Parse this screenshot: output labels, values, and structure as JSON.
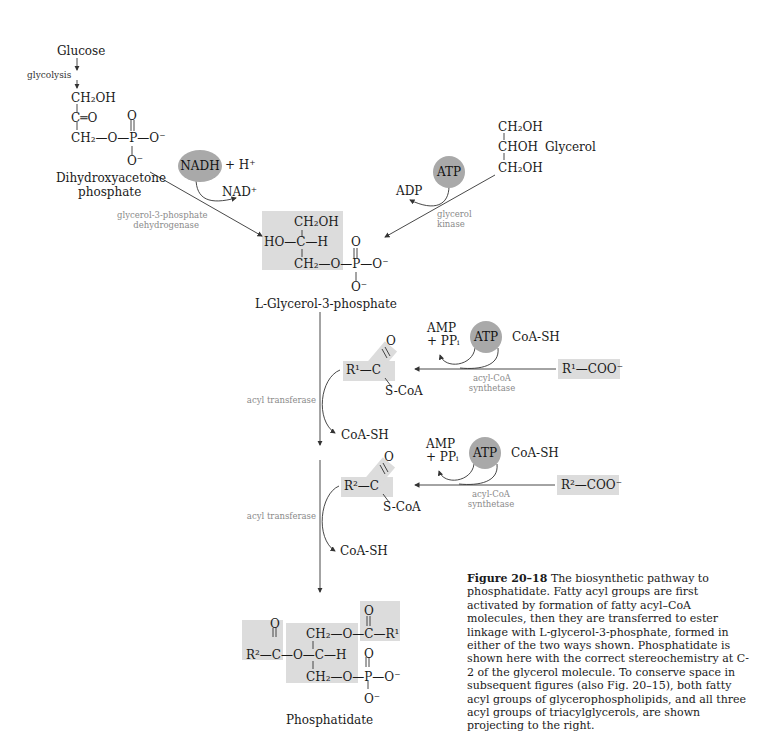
{
  "figure": {
    "number": "Figure 20–18",
    "caption": " The biosynthetic pathway to phosphatidate. Fatty acyl groups are first activated by formation of fatty acyl–CoA molecules, then they are transferred to ester linkage with L-glycerol-3-phosphate, formed in either of the two ways shown. Phosphatidate is shown here with the correct stereochemistry at C-2 of the glycerol molecule. To conserve space in subsequent figures (also Fig. 20–15), both fatty acyl groups of glycerophospholipids, and all three acyl groups of triacylglycerols, are shown projecting to the right."
  },
  "colors": {
    "shade": "#dcdcdc",
    "cofactor_circle": "#a9a9a9",
    "enzyme_text": "#8a8a8a",
    "line": "#333333"
  },
  "left_branch": {
    "start": "Glucose",
    "step_label": "glycolysis",
    "dhap": {
      "line1": "CH₂OH",
      "line2": "C═O",
      "line3": "CH₂—O—P—O⁻",
      "p_top": "O",
      "p_bottom": "O⁻",
      "name_line1": "Dihydroxyacetone",
      "name_line2": "phosphate"
    },
    "cofactor": "NADH",
    "cofactor_extra": "+ H⁺",
    "product": "NAD⁺",
    "enzyme_line1": "glycerol-3-phosphate",
    "enzyme_line2": "dehydrogenase"
  },
  "right_branch": {
    "glycerol": {
      "line1": "CH₂OH",
      "line2": "CHOH",
      "line3": "CH₂OH",
      "name": "Glycerol"
    },
    "cofactor": "ATP",
    "product": "ADP",
    "enzyme_line1": "glycerol",
    "enzyme_line2": "kinase"
  },
  "g3p": {
    "line1": "CH₂OH",
    "line2": "HO—C—H",
    "line3": "CH₂—O—P—O⁻",
    "p_top": "O",
    "p_bottom": "O⁻",
    "name": "L-Glycerol-3-phosphate"
  },
  "acyl_steps": [
    {
      "acyl_coa": {
        "r": "R¹—C",
        "o": "O",
        "scoa": "S-CoA"
      },
      "enzyme": "acyl transferase",
      "released": "CoA-SH",
      "activation": {
        "substrate": "R¹—COO⁻",
        "cofactor": "ATP",
        "coa_in": "CoA-SH",
        "products_line1": "AMP",
        "products_line2": "+ PPᵢ",
        "enzyme_line1": "acyl-CoA",
        "enzyme_line2": "synthetase"
      }
    },
    {
      "acyl_coa": {
        "r": "R²—C",
        "o": "O",
        "scoa": "S-CoA"
      },
      "enzyme": "acyl transferase",
      "released": "CoA-SH",
      "activation": {
        "substrate": "R²—COO⁻",
        "cofactor": "ATP",
        "coa_in": "CoA-SH",
        "products_line1": "AMP",
        "products_line2": "+ PPᵢ",
        "enzyme_line1": "acyl-CoA",
        "enzyme_line2": "synthetase"
      }
    }
  ],
  "phosphatidate": {
    "r2": "R²—C—O—C—H",
    "top_line": "CH₂—O—C—R¹",
    "bottom_line": "CH₂—O—P—O⁻",
    "o_left": "O",
    "o_right": "O",
    "o_p_top": "O",
    "o_p_bottom": "O⁻",
    "name": "Phosphatidate"
  }
}
